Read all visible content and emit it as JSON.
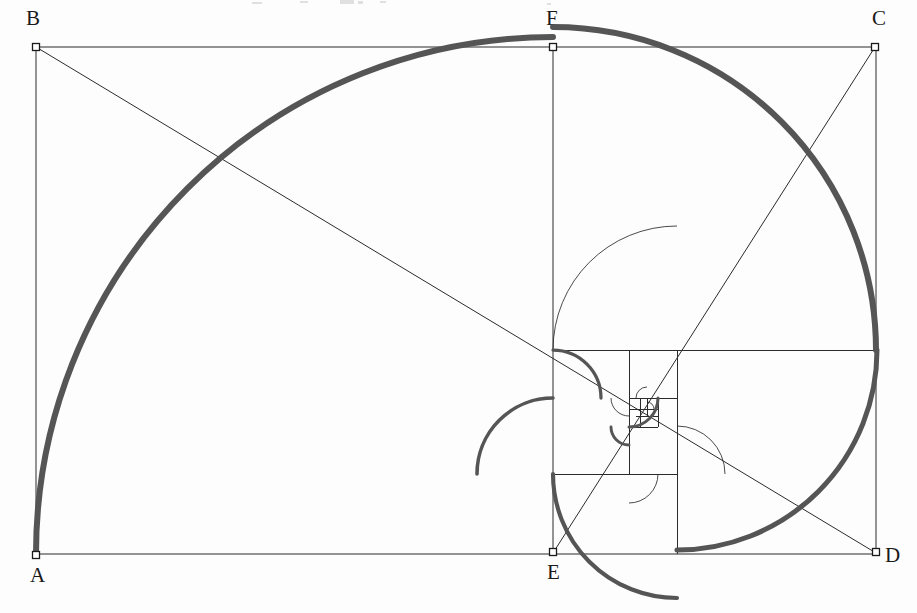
{
  "figure": {
    "background_color": "#fdfdfd",
    "stroke_color": "#2b2b2b",
    "spiral_color": "#555555",
    "thin_line_width": 1,
    "spiral_line_width": 6,
    "canvas": {
      "width": 917,
      "height": 613
    }
  },
  "labels": {
    "a": "A",
    "b": "B",
    "c": "C",
    "d": "D",
    "e": "E",
    "f": "F"
  },
  "vertices": [
    {
      "name": "A",
      "label": "A",
      "x": 36,
      "y": 555,
      "label_x": 30,
      "label_y": 565
    },
    {
      "name": "B",
      "label": "B",
      "x": 36,
      "y": 47,
      "label_x": 26,
      "label_y": 8
    },
    {
      "name": "C",
      "label": "C",
      "x": 875,
      "y": 47,
      "label_x": 872,
      "label_y": 8
    },
    {
      "name": "D",
      "label": "D",
      "x": 876,
      "y": 552,
      "label_x": 885,
      "label_y": 545
    },
    {
      "name": "E",
      "label": "E",
      "x": 553,
      "y": 552,
      "label_x": 547,
      "label_y": 562
    },
    {
      "name": "F",
      "label": "F",
      "x": 553,
      "y": 47,
      "label_x": 546,
      "label_y": 8
    }
  ],
  "outer_rectangle": {
    "name": "ABCD",
    "left": 36,
    "top": 47,
    "right": 876,
    "bottom": 554
  },
  "construction_lines": [
    {
      "name": "rect-top-AB-to-C",
      "x1": 36,
      "y1": 47,
      "x2": 876,
      "y2": 47
    },
    {
      "name": "rect-left-B-to-A",
      "x1": 36,
      "y1": 47,
      "x2": 36,
      "y2": 555
    },
    {
      "name": "rect-bottom-A-to-D",
      "x1": 36,
      "y1": 554,
      "x2": 876,
      "y2": 554
    },
    {
      "name": "rect-right-C-to-D",
      "x1": 876,
      "y1": 47,
      "x2": 876,
      "y2": 554
    },
    {
      "name": "square-divider-F-to-E",
      "x1": 553,
      "y1": 47,
      "x2": 553,
      "y2": 554
    },
    {
      "name": "diagonal-B-to-D",
      "x1": 36,
      "y1": 47,
      "x2": 876,
      "y2": 553
    },
    {
      "name": "diagonal-C-to-E",
      "x1": 875,
      "y1": 47,
      "x2": 553,
      "y2": 553
    }
  ],
  "nested_squares": [
    {
      "step": 1,
      "name": "square-ABFE",
      "x": 36,
      "y": 47,
      "size": 507
    },
    {
      "step": 2,
      "name": "square-upper-right",
      "x": 553,
      "y": 350,
      "size": 323,
      "band": "right-lower"
    },
    {
      "step": 3,
      "name": "square-3",
      "x": 553,
      "y": 350,
      "size": 124
    },
    {
      "step": 4,
      "name": "square-4",
      "x": 629,
      "y": 350,
      "size": 48
    },
    {
      "step": 5,
      "name": "square-5",
      "x": 629,
      "y": 398,
      "size": 29
    },
    {
      "step": 6,
      "name": "square-6",
      "x": 629,
      "y": 398,
      "size": 18
    },
    {
      "step": 7,
      "name": "square-7",
      "x": 640,
      "y": 398,
      "size": 11
    },
    {
      "step": 8,
      "name": "square-8",
      "x": 640,
      "y": 409,
      "size": 7
    }
  ],
  "grid_lines_inner": [
    {
      "name": "inner-h-350",
      "x1": 553,
      "y1": 350,
      "x2": 876,
      "y2": 350
    },
    {
      "name": "inner-v-677",
      "x1": 677,
      "y1": 350,
      "x2": 677,
      "y2": 554
    },
    {
      "name": "inner-h-474",
      "x1": 553,
      "y1": 474,
      "x2": 677,
      "y2": 474
    },
    {
      "name": "inner-v-629",
      "x1": 629,
      "y1": 350,
      "x2": 629,
      "y2": 474
    },
    {
      "name": "inner-h-398",
      "x1": 629,
      "y1": 398,
      "x2": 677,
      "y2": 398
    },
    {
      "name": "inner-v-658",
      "x1": 658,
      "y1": 398,
      "x2": 658,
      "y2": 427
    },
    {
      "name": "inner-h-427",
      "x1": 629,
      "y1": 427,
      "x2": 658,
      "y2": 427
    },
    {
      "name": "inner-v-640",
      "x1": 640,
      "y1": 398,
      "x2": 640,
      "y2": 427
    },
    {
      "name": "inner-h-409",
      "x1": 629,
      "y1": 409,
      "x2": 658,
      "y2": 409
    },
    {
      "name": "inner-v-647",
      "x1": 647,
      "y1": 398,
      "x2": 647,
      "y2": 416
    },
    {
      "name": "inner-h-416",
      "x1": 636,
      "y1": 416,
      "x2": 658,
      "y2": 416
    }
  ],
  "spiral_arcs": [
    {
      "step": 1,
      "name": "arc-quarter-1",
      "cx": 553,
      "cy": 554,
      "r": 517,
      "start_deg": 180,
      "sweep_deg": 90,
      "note": "from A up over to F"
    },
    {
      "step": 2,
      "name": "arc-quarter-2",
      "cx": 553,
      "cy": 350,
      "r": 323,
      "start_deg": 270,
      "sweep_deg": 90,
      "note": "from F across to right edge"
    },
    {
      "step": 3,
      "name": "arc-quarter-3",
      "cx": 677,
      "cy": 350,
      "r": 200,
      "start_deg": 0,
      "sweep_deg": 90,
      "note": "down to bottom"
    },
    {
      "step": 4,
      "name": "arc-quarter-4",
      "cx": 677,
      "cy": 474,
      "r": 124,
      "start_deg": 90,
      "sweep_deg": 90,
      "note": "back to left"
    },
    {
      "step": 5,
      "name": "arc-quarter-5",
      "cx": 553,
      "cy": 474,
      "r": 76,
      "start_deg": 180,
      "sweep_deg": 90
    },
    {
      "step": 6,
      "name": "arc-quarter-6",
      "cx": 553,
      "cy": 398,
      "r": 48,
      "start_deg": 270,
      "sweep_deg": 90
    },
    {
      "step": 7,
      "name": "arc-quarter-7",
      "cx": 629,
      "cy": 398,
      "r": 29,
      "start_deg": 0,
      "sweep_deg": 90
    },
    {
      "step": 8,
      "name": "arc-quarter-8",
      "cx": 629,
      "cy": 427,
      "r": 18,
      "start_deg": 90,
      "sweep_deg": 90
    }
  ],
  "thin_arcs": [
    {
      "name": "thin-arc-3",
      "cx": 677,
      "cy": 350,
      "r": 124,
      "start_deg": 180,
      "sweep_deg": 90
    },
    {
      "name": "thin-arc-4",
      "cx": 677,
      "cy": 474,
      "r": 48,
      "start_deg": 270,
      "sweep_deg": 90
    },
    {
      "name": "thin-arc-5",
      "cx": 629,
      "cy": 474,
      "r": 29,
      "start_deg": 0,
      "sweep_deg": 90
    },
    {
      "name": "thin-arc-6",
      "cx": 629,
      "cy": 398,
      "r": 18,
      "start_deg": 90,
      "sweep_deg": 90
    },
    {
      "name": "thin-arc-7",
      "cx": 647,
      "cy": 398,
      "r": 11,
      "start_deg": 180,
      "sweep_deg": 90
    },
    {
      "name": "thin-arc-8",
      "cx": 647,
      "cy": 409,
      "r": 7,
      "start_deg": 270,
      "sweep_deg": 90
    }
  ],
  "vertex_marker": {
    "name": "open-square-node",
    "size": 7,
    "fill": "#ffffff",
    "stroke": "#1a1a1a"
  },
  "artifacts": {
    "note": "faint scan remnant of clipped text along the very top edge",
    "specks": [
      {
        "x": 340,
        "y": 0,
        "w": 14,
        "h": 4
      },
      {
        "x": 358,
        "y": 1,
        "w": 5,
        "h": 3
      },
      {
        "x": 300,
        "y": 1,
        "w": 8,
        "h": 2
      },
      {
        "x": 380,
        "y": 1,
        "w": 6,
        "h": 2
      },
      {
        "x": 252,
        "y": 2,
        "w": 10,
        "h": 2
      },
      {
        "x": 547,
        "y": 3,
        "w": 4,
        "h": 2
      }
    ]
  }
}
